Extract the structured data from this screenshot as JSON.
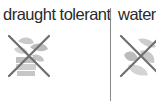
{
  "columns": [
    {
      "label": "draught tolerant",
      "icon": "crossed-out-plant-icon"
    },
    {
      "label": "water",
      "icon": "crossed-out-plant-icon"
    }
  ],
  "colors": {
    "text": "#2a2a2a",
    "divider": "#8a8a8a",
    "cross": "#6e6e6e",
    "plant": "#c8c8c8"
  }
}
